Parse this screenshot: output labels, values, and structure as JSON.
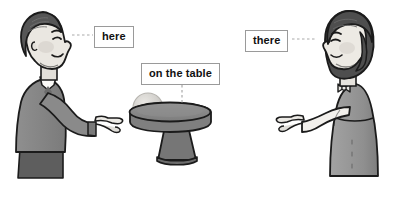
{
  "scene": {
    "title": "here / on the table / there deixis illustration",
    "width": 411,
    "height": 197,
    "background_color": "#ffffff",
    "style": "grayscale cartoon line drawing"
  },
  "labels": [
    {
      "id": "here",
      "text": "here",
      "points_to": "man-on-left",
      "connector": "horizontal dotted line from box left edge to man's face",
      "box_border_color": "#9a9a9a",
      "text_color": "#111111"
    },
    {
      "id": "on_the_table",
      "text": "on the table",
      "points_to": "ball-on-pedestal-table",
      "connector": "vertical dotted line from box bottom down to table top",
      "box_border_color": "#9a9a9a",
      "text_color": "#111111"
    },
    {
      "id": "there",
      "text": "there",
      "points_to": "woman-on-right",
      "connector": "horizontal dotted line from box right edge to woman's face",
      "box_border_color": "#9a9a9a",
      "text_color": "#111111"
    }
  ],
  "figures": [
    {
      "id": "man",
      "description": "Man in profile facing right, short dark hair, wearing a dark gray jacket over a white collared shirt and darker trousers, right arm extended forward pointing with index finger toward the table",
      "position": "left",
      "hair_color": "#5a5a5a",
      "skin_color": "#e6e2dc",
      "clothing_color": "#8c8c8c",
      "trousers_color": "#5f5f5f",
      "outline_color": "#1b1b1b"
    },
    {
      "id": "woman",
      "description": "Woman in profile facing left, shoulder-length dark bob hair, wearing a gray dress with a bow at the neck and a light sleeve, left arm extended forward pointing with index finger toward the table",
      "position": "right",
      "hair_color": "#4f4f4f",
      "skin_color": "#ece8e2",
      "clothing_color": "#9a9a9a",
      "sleeve_color": "#f1efea",
      "outline_color": "#1b1b1b"
    }
  ],
  "objects": [
    {
      "id": "table",
      "description": "Round pedestal table with thick elliptical top and flared trapezoid base",
      "top_color": "#8a8a8a",
      "edge_color": "#6e6e6e",
      "base_color": "#767676",
      "outline_color": "#1b1b1b"
    },
    {
      "id": "ball",
      "description": "Light gray sphere resting on the left side of the table top",
      "fill_color": "#cfcdc8",
      "highlight_color": "#e2e0dc",
      "outline_color": "#b3b1ac"
    }
  ],
  "palette": {
    "outline": "#1b1b1b",
    "dotted_connector": "#aaaaaa",
    "label_border": "#9a9a9a",
    "label_text": "#111111",
    "white": "#ffffff",
    "shadow": "#d8d6d2"
  }
}
